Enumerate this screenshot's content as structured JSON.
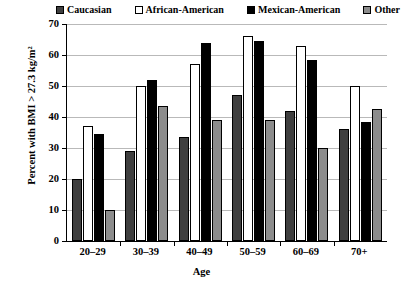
{
  "chart_data": {
    "type": "bar",
    "title": "",
    "xlabel": "Age",
    "ylabel": "Percent with BMI > 27.3 kg/m²",
    "ylim": [
      0,
      70
    ],
    "ytick_step": 10,
    "yticks": [
      70,
      60,
      50,
      40,
      30,
      20,
      10,
      0
    ],
    "grid": true,
    "legend_position": "top",
    "categories": [
      "20–29",
      "30–39",
      "40–49",
      "50–59",
      "60–69",
      "70+"
    ],
    "series": [
      {
        "name": "Caucasian",
        "color": "#3f3f3f",
        "values": [
          20.0,
          29.0,
          33.5,
          47.0,
          42.0,
          36.0
        ]
      },
      {
        "name": "African-American",
        "color": "#ffffff",
        "values": [
          37.0,
          50.0,
          57.0,
          66.0,
          63.0,
          50.0
        ]
      },
      {
        "name": "Mexican-American",
        "color": "#000000",
        "values": [
          34.5,
          52.0,
          64.0,
          64.5,
          58.5,
          38.5
        ]
      },
      {
        "name": "Other",
        "color": "#8c8c8c",
        "values": [
          10.0,
          43.5,
          39.0,
          39.0,
          30.0,
          42.5
        ]
      }
    ]
  },
  "axis": {
    "y_title": "Percent with BMI > 27.3 kg/m²",
    "x_title": "Age"
  }
}
